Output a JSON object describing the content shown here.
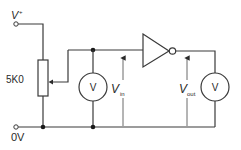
{
  "diagram": {
    "type": "circuit",
    "supply": {
      "label": "V",
      "superscript": "+"
    },
    "ground": {
      "label": "0V"
    },
    "potentiometer": {
      "label": "5K0"
    },
    "voltmeter_in": {
      "label": "V"
    },
    "voltmeter_out": {
      "label": "V"
    },
    "v_in": {
      "label": "V",
      "subscript": "in"
    },
    "v_out": {
      "label": "V",
      "subscript": "out"
    },
    "gate": {
      "type": "NOT (inverter)"
    },
    "colors": {
      "line": "#3a3a3a",
      "background": "#ffffff"
    }
  }
}
